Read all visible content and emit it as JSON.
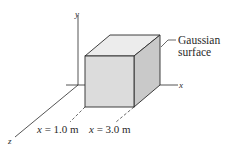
{
  "diagram": {
    "type": "gaussian-surface-cube",
    "axes": {
      "y_label": "y",
      "x_label": "x",
      "z_label": "z"
    },
    "callout": {
      "line1": "Gaussian",
      "line2": "surface"
    },
    "positions": [
      {
        "var": "x",
        "eq": " = 1.0 m"
      },
      {
        "var": "x",
        "eq": " = 3.0 m"
      }
    ],
    "colors": {
      "front_face": "#dcdcdc",
      "top_face": "#ececec",
      "side_face": "#c9c9c9",
      "stroke": "#2a2a2a"
    }
  }
}
